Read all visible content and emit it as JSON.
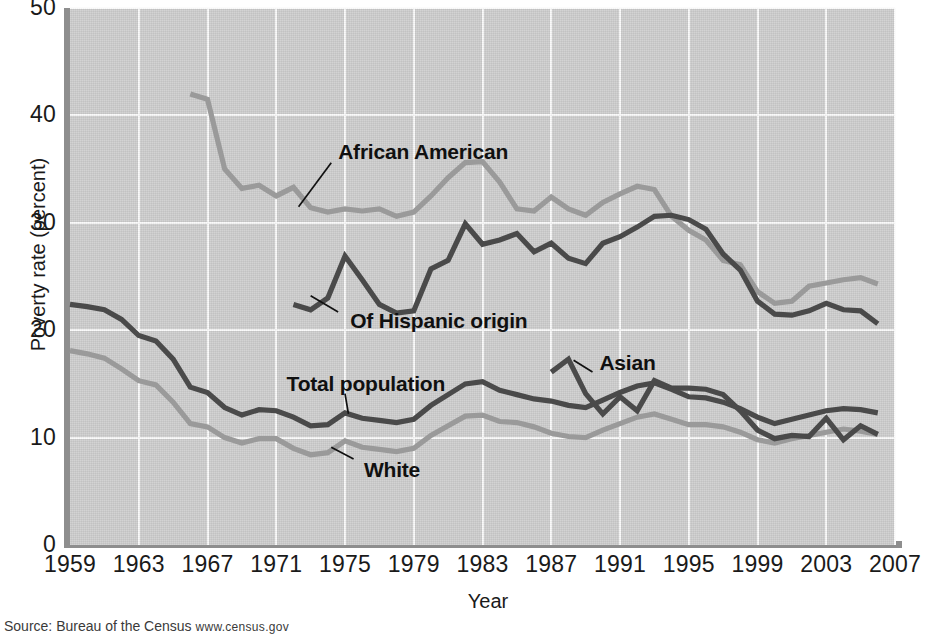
{
  "chart_data": {
    "type": "line",
    "title": "",
    "xlabel": "Year",
    "ylabel": "Poverty rate (percent)",
    "xlim": [
      1959,
      2007
    ],
    "ylim": [
      0,
      50
    ],
    "xticks": [
      1959,
      1963,
      1967,
      1971,
      1975,
      1979,
      1983,
      1987,
      1991,
      1995,
      1999,
      2003,
      2007
    ],
    "yticks": [
      0,
      10,
      20,
      30,
      40,
      50
    ],
    "grid": true,
    "legend_position": "inline-annotations",
    "series": [
      {
        "name": "African American",
        "color": "#9a9a9a",
        "label_xy": [
          1974.6,
          36.6
        ],
        "x": [
          1966,
          1967,
          1968,
          1969,
          1970,
          1971,
          1972,
          1973,
          1974,
          1975,
          1976,
          1977,
          1978,
          1979,
          1980,
          1981,
          1982,
          1983,
          1984,
          1985,
          1986,
          1987,
          1988,
          1989,
          1990,
          1991,
          1992,
          1993,
          1994,
          1995,
          1996,
          1997,
          1998,
          1999,
          2000,
          2001,
          2002,
          2003,
          2004,
          2005,
          2006
        ],
        "values": [
          42.0,
          41.5,
          35.0,
          33.2,
          33.5,
          32.5,
          33.3,
          31.4,
          31.0,
          31.3,
          31.1,
          31.3,
          30.6,
          31.0,
          32.5,
          34.2,
          35.6,
          35.7,
          33.8,
          31.3,
          31.1,
          32.4,
          31.3,
          30.7,
          31.9,
          32.7,
          33.4,
          33.1,
          30.6,
          29.3,
          28.4,
          26.5,
          26.1,
          23.6,
          22.5,
          22.7,
          24.1,
          24.4,
          24.7,
          24.9,
          24.3
        ]
      },
      {
        "name": "Of Hispanic origin",
        "color": "#4a4a4a",
        "label_xy": [
          1975.3,
          20.9
        ],
        "x": [
          1972,
          1973,
          1974,
          1975,
          1976,
          1977,
          1978,
          1979,
          1980,
          1981,
          1982,
          1983,
          1984,
          1985,
          1986,
          1987,
          1988,
          1989,
          1990,
          1991,
          1992,
          1993,
          1994,
          1995,
          1996,
          1997,
          1998,
          1999,
          2000,
          2001,
          2002,
          2003,
          2004,
          2005,
          2006
        ],
        "values": [
          22.4,
          21.9,
          23.0,
          26.9,
          24.7,
          22.4,
          21.6,
          21.8,
          25.7,
          26.5,
          29.9,
          28.0,
          28.4,
          29.0,
          27.3,
          28.1,
          26.7,
          26.2,
          28.1,
          28.7,
          29.6,
          30.6,
          30.7,
          30.3,
          29.4,
          27.1,
          25.6,
          22.7,
          21.5,
          21.4,
          21.8,
          22.5,
          21.9,
          21.8,
          20.6
        ]
      },
      {
        "name": "Total population",
        "color": "#4a4a4a",
        "label_xy": [
          1971.6,
          15.0
        ],
        "x": [
          1959,
          1960,
          1961,
          1962,
          1963,
          1964,
          1965,
          1966,
          1967,
          1968,
          1969,
          1970,
          1971,
          1972,
          1973,
          1974,
          1975,
          1976,
          1977,
          1978,
          1979,
          1980,
          1981,
          1982,
          1983,
          1984,
          1985,
          1986,
          1987,
          1988,
          1989,
          1990,
          1991,
          1992,
          1993,
          1994,
          1995,
          1996,
          1997,
          1998,
          1999,
          2000,
          2001,
          2002,
          2003,
          2004,
          2005,
          2006
        ],
        "values": [
          22.4,
          22.2,
          21.9,
          21.0,
          19.5,
          19.0,
          17.3,
          14.7,
          14.2,
          12.8,
          12.1,
          12.6,
          12.5,
          11.9,
          11.1,
          11.2,
          12.3,
          11.8,
          11.6,
          11.4,
          11.7,
          13.0,
          14.0,
          15.0,
          15.2,
          14.4,
          14.0,
          13.6,
          13.4,
          13.0,
          12.8,
          13.5,
          14.2,
          14.8,
          15.1,
          14.5,
          13.8,
          13.7,
          13.3,
          12.7,
          11.9,
          11.3,
          11.7,
          12.1,
          12.5,
          12.7,
          12.6,
          12.3
        ]
      },
      {
        "name": "White",
        "color": "#9a9a9a",
        "label_xy": [
          1976.1,
          7.0
        ],
        "x": [
          1959,
          1960,
          1961,
          1962,
          1963,
          1964,
          1965,
          1966,
          1967,
          1968,
          1969,
          1970,
          1971,
          1972,
          1973,
          1974,
          1975,
          1976,
          1977,
          1978,
          1979,
          1980,
          1981,
          1982,
          1983,
          1984,
          1985,
          1986,
          1987,
          1988,
          1989,
          1990,
          1991,
          1992,
          1993,
          1994,
          1995,
          1996,
          1997,
          1998,
          1999,
          2000,
          2001,
          2002,
          2003,
          2004,
          2005,
          2006
        ],
        "values": [
          18.1,
          17.8,
          17.4,
          16.4,
          15.3,
          14.9,
          13.3,
          11.3,
          11.0,
          10.0,
          9.5,
          9.9,
          9.9,
          9.0,
          8.4,
          8.6,
          9.7,
          9.1,
          8.9,
          8.7,
          9.0,
          10.2,
          11.1,
          12.0,
          12.1,
          11.5,
          11.4,
          11.0,
          10.4,
          10.1,
          10.0,
          10.7,
          11.3,
          11.9,
          12.2,
          11.7,
          11.2,
          11.2,
          11.0,
          10.5,
          9.8,
          9.5,
          9.9,
          10.2,
          10.5,
          10.8,
          10.6,
          10.3
        ]
      },
      {
        "name": "Asian",
        "color": "#4a4a4a",
        "label_xy": [
          1989.8,
          16.9
        ],
        "x": [
          1987,
          1988,
          1989,
          1990,
          1991,
          1992,
          1993,
          1994,
          1995,
          1996,
          1997,
          1998,
          1999,
          2000,
          2001,
          2002,
          2003,
          2004,
          2005,
          2006
        ],
        "values": [
          16.1,
          17.3,
          14.1,
          12.2,
          13.8,
          12.5,
          15.3,
          14.6,
          14.6,
          14.5,
          14.0,
          12.5,
          10.7,
          9.9,
          10.2,
          10.1,
          11.8,
          9.8,
          11.1,
          10.3
        ]
      }
    ]
  },
  "axis": {
    "ylabel": "Poverty rate (percent)",
    "xlabel": "Year",
    "yticks": [
      "50",
      "40",
      "30",
      "20",
      "10",
      "0"
    ],
    "xticks": [
      "1959",
      "1963",
      "1967",
      "1971",
      "1975",
      "1979",
      "1983",
      "1987",
      "1991",
      "1995",
      "1999",
      "2003",
      "2007"
    ]
  },
  "annotations": [
    {
      "label": "African American"
    },
    {
      "label": "Of Hispanic origin"
    },
    {
      "label": "Total population"
    },
    {
      "label": "White"
    },
    {
      "label": "Asian"
    }
  ],
  "source": {
    "prefix": "Source: Bureau of the Census ",
    "url": "www.census.gov"
  },
  "colors": {
    "plot_background": "#cfcfcf",
    "gridline": "#fbfbfb",
    "axis_spine": "#8e8e8e",
    "dark_series": "#4a4a4a",
    "light_series": "#9a9a9a"
  }
}
